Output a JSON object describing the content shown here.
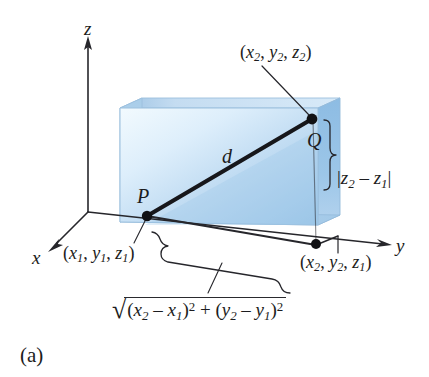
{
  "figure": {
    "caption": "(a)",
    "topic": "Distance formula between two points in three-dimensional space",
    "colors": {
      "box_front_light": "#eef7fd",
      "box_front_mid": "#bad8f0",
      "box_front_dark": "#9ac5e8",
      "box_top": "#b6d5ee",
      "box_side_left": "#a8cbe9",
      "box_side_right": "#8fbde4",
      "box_edge": "#8fb8d8",
      "line": "#1c1c20",
      "text": "#1c1c20"
    }
  },
  "axes": {
    "z_label": "z",
    "y_label": "y",
    "x_label": "x"
  },
  "points": {
    "P_label": "P",
    "Q_label": "Q",
    "segment_label": "d"
  },
  "labels": {
    "q_coords": {
      "open": "(",
      "x": "x",
      "x_sub": "2",
      "sep1": ", ",
      "y": "y",
      "y_sub": "2",
      "sep2": ", ",
      "z": "z",
      "z_sub": "2",
      "close": ")"
    },
    "p_coords": {
      "open": "(",
      "x": "x",
      "x_sub": "1",
      "sep1": ", ",
      "y": "y",
      "y_sub": "1",
      "sep2": ", ",
      "z": "z",
      "z_sub": "1",
      "close": ")"
    },
    "base_coords": {
      "open": "(",
      "x": "x",
      "x_sub": "2",
      "sep1": ", ",
      "y": "y",
      "y_sub": "2",
      "sep2": ", ",
      "z": "z",
      "z_sub": "1",
      "close": ")"
    },
    "z_difference": {
      "bar_open": "|",
      "z1": "z",
      "z1_sub": "2",
      "minus": " – ",
      "z2": "z",
      "z2_sub": "1",
      "bar_close": "|"
    },
    "radical": {
      "sign": "√",
      "open1": "(",
      "x2": "x",
      "x2_sub": "2",
      "minus1": " – ",
      "x1": "x",
      "x1_sub": "1",
      "close1": ")",
      "pow1": "2",
      "plus": " + ",
      "open2": "(",
      "y2": "y",
      "y2_sub": "2",
      "minus2": " – ",
      "y1": "y",
      "y1_sub": "1",
      "close2": ")",
      "pow2": "2"
    }
  }
}
